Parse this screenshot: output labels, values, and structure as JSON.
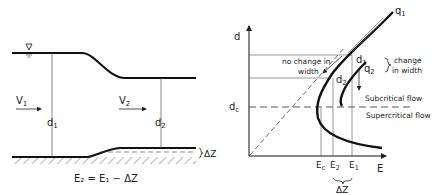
{
  "left_diagram": {
    "v1": "V",
    "v1_sub": "1",
    "v2": "V",
    "v2_sub": "2",
    "d1": "d",
    "d1_sub": "1",
    "d2": "d",
    "d2_sub": "2",
    "delta_z": "ΔZ",
    "equation": "E₂ = E₁ − ΔZ",
    "water_surface_symbol": "▽"
  },
  "right_diagram": {
    "y_axis": "d",
    "x_axis": "E",
    "curve_q1": "q",
    "curve_q1_sub": "1",
    "curve_q2": "q",
    "curve_q2_sub": "2",
    "d1": "d",
    "d1_sub": "1",
    "d2": "d",
    "d2_sub": "2",
    "dc": "d",
    "dc_sub": "c",
    "no_change_line1": "no change in",
    "no_change_line2": "width",
    "change_line1": "change",
    "change_line2": "in width",
    "subcritical": "Subcritical flow",
    "supercritical": "Supercritical flow",
    "ec": "E",
    "ec_sub": "c",
    "e2": "E",
    "e2_sub": "2",
    "e1": "E",
    "e1_sub": "1",
    "delta_z": "ΔZ"
  }
}
